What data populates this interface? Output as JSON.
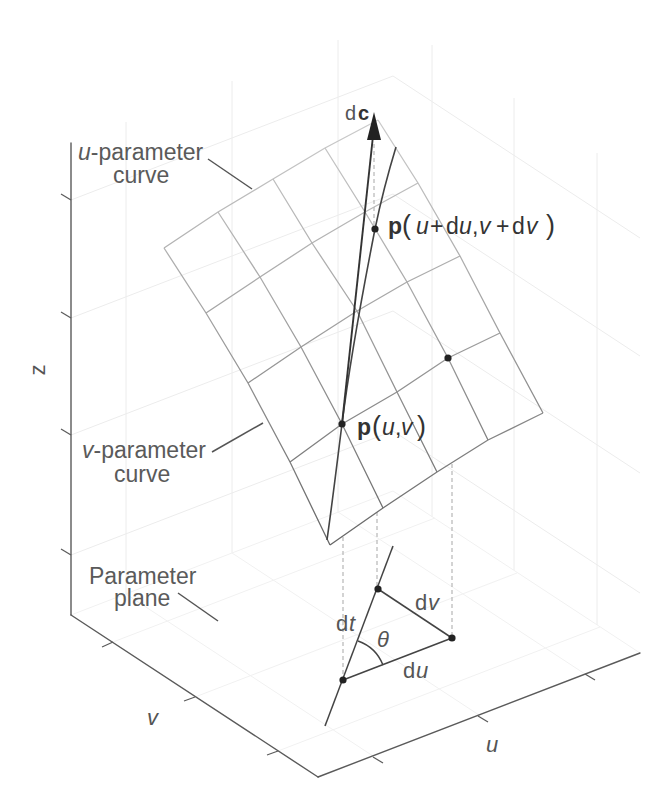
{
  "axes": {
    "u_label": "u",
    "v_label": "v",
    "z_label": "z"
  },
  "annotations": {
    "u_curve": {
      "var": "u",
      "suffix": "-parameter",
      "line2": "curve"
    },
    "v_curve": {
      "var": "v",
      "suffix": "-parameter",
      "line2": "curve"
    },
    "parameter_plane": {
      "line1": "Parameter",
      "line2": "plane"
    },
    "dc": {
      "d": "d",
      "c": "c"
    },
    "p_uv": {
      "parts": [
        {
          "t": "p"
        },
        {
          "t": "("
        },
        {
          "t": "u"
        },
        {
          "t": ","
        },
        {
          "t": "v"
        },
        {
          "t": ")"
        }
      ]
    },
    "p_uv_shifted": {
      "parts": [
        {
          "t": "p"
        },
        {
          "t": "("
        },
        {
          "t": "u"
        },
        {
          "t": "+"
        },
        {
          "t": "d"
        },
        {
          "t": "u"
        },
        {
          "t": ","
        },
        {
          "t": "v"
        },
        {
          "t": "+"
        },
        {
          "t": "d"
        },
        {
          "t": "v"
        },
        {
          "t": ")"
        }
      ]
    },
    "triangle": {
      "dt": {
        "d": "d",
        "var": "t"
      },
      "du": {
        "d": "d",
        "var": "u"
      },
      "dv": {
        "d": "d",
        "var": "v"
      },
      "theta": "θ"
    }
  },
  "colors": {
    "point": "#222222",
    "vector": "#333333",
    "surface_light": "#cccccc",
    "surface_dark": "#646464",
    "label_text": "#5a5a5a",
    "gridline": "#ececec"
  }
}
